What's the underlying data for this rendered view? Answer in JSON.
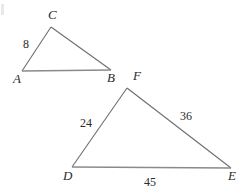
{
  "figure": {
    "type": "geometry-diagram",
    "background_color": "#ffffff",
    "stroke_color": "#6e6e6e",
    "text_color": "#2b2b2b"
  },
  "triangles": [
    {
      "name": "triangle-abc",
      "vertices": [
        {
          "id": "A",
          "label": "A",
          "x": 22,
          "y": 71
        },
        {
          "id": "B",
          "label": "B",
          "x": 111,
          "y": 70
        },
        {
          "id": "C",
          "label": "C",
          "x": 51,
          "y": 27
        }
      ],
      "vertex_label_positions": [
        {
          "id": "A",
          "x": 13,
          "y": 72
        },
        {
          "id": "B",
          "x": 107,
          "y": 71
        },
        {
          "id": "C",
          "x": 48,
          "y": 8
        }
      ],
      "side_labels": [
        {
          "side": "AC",
          "value": "8",
          "x": 23,
          "y": 38
        }
      ]
    },
    {
      "name": "triangle-def",
      "vertices": [
        {
          "id": "D",
          "label": "D",
          "x": 72,
          "y": 167
        },
        {
          "id": "E",
          "label": "E",
          "x": 231,
          "y": 168
        },
        {
          "id": "F",
          "label": "F",
          "x": 127,
          "y": 88
        }
      ],
      "vertex_label_positions": [
        {
          "id": "D",
          "x": 63,
          "y": 169
        },
        {
          "id": "E",
          "x": 228,
          "y": 169
        },
        {
          "id": "F",
          "x": 133,
          "y": 69
        }
      ],
      "side_labels": [
        {
          "side": "DF",
          "value": "24",
          "x": 80,
          "y": 117
        },
        {
          "side": "FE",
          "value": "36",
          "x": 180,
          "y": 110
        },
        {
          "side": "DE",
          "value": "45",
          "x": 144,
          "y": 176
        }
      ]
    }
  ],
  "labels": {
    "A": "A",
    "B": "B",
    "C": "C",
    "D": "D",
    "E": "E",
    "F": "F",
    "side_ac": "8",
    "side_df": "24",
    "side_fe": "36",
    "side_de": "45"
  }
}
